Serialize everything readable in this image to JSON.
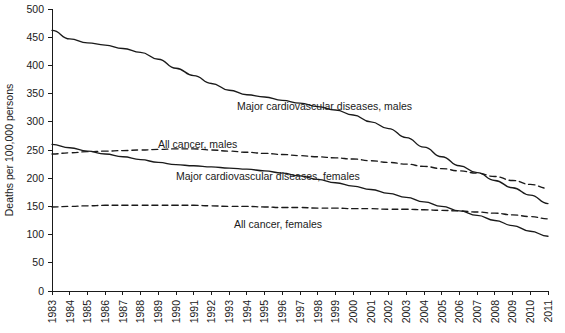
{
  "chart_data": {
    "type": "line",
    "title": "",
    "xlabel": "",
    "ylabel": "Deaths per 100,000 persons",
    "ylim": [
      0,
      500
    ],
    "ytick_step": 50,
    "yticks": [
      "0",
      "50",
      "100",
      "150",
      "200",
      "250",
      "300",
      "350",
      "400",
      "450",
      "500"
    ],
    "grid": false,
    "legend": "inline-annotations",
    "x": [
      1983,
      1984,
      1985,
      1986,
      1987,
      1988,
      1989,
      1990,
      1991,
      1992,
      1993,
      1994,
      1995,
      1996,
      1997,
      1998,
      1999,
      2000,
      2001,
      2002,
      2003,
      2004,
      2005,
      2006,
      2007,
      2008,
      2009,
      2010,
      2011
    ],
    "xticks": [
      "1983",
      "1984",
      "1985",
      "1986",
      "1987",
      "1988",
      "1989",
      "1990",
      "1991",
      "1992",
      "1993",
      "1994",
      "1995",
      "1996",
      "1997",
      "1998",
      "1999",
      "2000",
      "2001",
      "2002",
      "2003",
      "2004",
      "2005",
      "2006",
      "2007",
      "2008",
      "2009",
      "2010",
      "2011"
    ],
    "series": [
      {
        "name": "Major cardiovascular diseases, males",
        "style": "solid",
        "label": "Major cardiovascular diseases, males",
        "label_x": 2030,
        "values": [
          462,
          447,
          440,
          436,
          430,
          423,
          411,
          395,
          382,
          368,
          356,
          348,
          344,
          338,
          333,
          327,
          321,
          312,
          300,
          288,
          272,
          255,
          238,
          222,
          210,
          196,
          183,
          170,
          155
        ]
      },
      {
        "name": "All cancer, males",
        "style": "dashed",
        "label": "All cancer, males",
        "label_x": 1989,
        "values": [
          243,
          245,
          247,
          248,
          249,
          250,
          251,
          252,
          252,
          250,
          248,
          246,
          244,
          242,
          240,
          238,
          236,
          234,
          231,
          228,
          225,
          221,
          217,
          213,
          209,
          203,
          196,
          189,
          182
        ]
      },
      {
        "name": "Major cardiovascular diseases, females",
        "style": "solid",
        "label": "Major cardiovascular diseases, females",
        "label_x": 1993,
        "values": [
          260,
          254,
          248,
          243,
          238,
          233,
          228,
          224,
          222,
          220,
          218,
          216,
          213,
          209,
          204,
          198,
          192,
          186,
          180,
          173,
          166,
          158,
          150,
          142,
          134,
          125,
          116,
          106,
          97
        ]
      },
      {
        "name": "All cancer, females",
        "style": "dashed",
        "label": "All cancer, females",
        "label_x": 1996,
        "values": [
          149,
          150,
          151,
          152,
          152,
          152,
          152,
          152,
          152,
          151,
          150,
          150,
          149,
          148,
          148,
          147,
          147,
          146,
          146,
          145,
          145,
          144,
          143,
          142,
          140,
          138,
          135,
          132,
          128
        ]
      }
    ]
  }
}
